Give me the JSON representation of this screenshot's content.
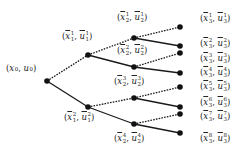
{
  "diagram": {
    "type": "tree",
    "root": {
      "id": "root",
      "label": "(x0, u0)",
      "x": 47,
      "y": 81,
      "label_x": 6,
      "label_y": 64,
      "plain": true
    },
    "nodes": [
      {
        "id": "n1_1",
        "var": "x",
        "ctl": "u",
        "sup": "1",
        "sub": "1",
        "x": 88,
        "y": 55,
        "label_x": 62,
        "label_y": 30
      },
      {
        "id": "n1_2",
        "var": "x",
        "ctl": "u",
        "sup": "2",
        "sub": "1",
        "x": 88,
        "y": 107,
        "label_x": 64,
        "label_y": 111
      },
      {
        "id": "n2_1",
        "var": "x",
        "ctl": "u",
        "sup": "1",
        "sub": "2",
        "x": 134,
        "y": 38,
        "label_x": 117,
        "label_y": 11
      },
      {
        "id": "n2_2",
        "var": "x",
        "ctl": "u",
        "sup": "2",
        "sub": "2",
        "x": 134,
        "y": 67,
        "label_x": 117,
        "label_y": 44
      },
      {
        "id": "n2_3",
        "var": "x",
        "ctl": "u",
        "sup": "3",
        "sub": "2",
        "x": 134,
        "y": 98,
        "label_x": 114,
        "label_y": 75
      },
      {
        "id": "n2_4",
        "var": "x",
        "ctl": "u",
        "sup": "4",
        "sub": "2",
        "x": 134,
        "y": 124,
        "label_x": 114,
        "label_y": 132
      },
      {
        "id": "n3_1",
        "var": "x",
        "ctl": "u",
        "sup": "1",
        "sub": "3",
        "x": 180,
        "y": 27,
        "label_x": 200,
        "label_y": 12
      },
      {
        "id": "n3_2",
        "var": "x",
        "ctl": "u",
        "sup": "2",
        "sub": "3",
        "x": 180,
        "y": 46,
        "label_x": 200,
        "label_y": 37
      },
      {
        "id": "n3_3",
        "var": "x",
        "ctl": "u",
        "sup": "3",
        "sub": "3",
        "x": 180,
        "y": 53,
        "label_x": 200,
        "label_y": 52
      },
      {
        "id": "n3_4",
        "var": "x",
        "ctl": "u",
        "sup": "4",
        "sub": "3",
        "x": 180,
        "y": 73,
        "label_x": 200,
        "label_y": 66
      },
      {
        "id": "n3_5",
        "var": "x",
        "ctl": "u",
        "sup": "5",
        "sub": "3",
        "x": 180,
        "y": 87,
        "label_x": 200,
        "label_y": 80
      },
      {
        "id": "n3_6",
        "var": "x",
        "ctl": "u",
        "sup": "6",
        "sub": "3",
        "x": 180,
        "y": 107,
        "label_x": 200,
        "label_y": 96
      },
      {
        "id": "n3_7",
        "var": "x",
        "ctl": "u",
        "sup": "7",
        "sub": "3",
        "x": 180,
        "y": 114,
        "label_x": 200,
        "label_y": 110
      },
      {
        "id": "n3_8",
        "var": "x",
        "ctl": "u",
        "sup": "8",
        "sub": "3",
        "x": 180,
        "y": 133,
        "label_x": 200,
        "label_y": 132
      }
    ],
    "edges": [
      {
        "from": "root",
        "to": "n1_1",
        "style": "dashed"
      },
      {
        "from": "root",
        "to": "n1_2",
        "style": "solid"
      },
      {
        "from": "n1_1",
        "to": "n2_1",
        "style": "dashed"
      },
      {
        "from": "n1_1",
        "to": "n2_2",
        "style": "solid"
      },
      {
        "from": "n1_2",
        "to": "n2_3",
        "style": "dashed"
      },
      {
        "from": "n1_2",
        "to": "n2_4",
        "style": "solid"
      },
      {
        "from": "n2_1",
        "to": "n3_1",
        "style": "dashed"
      },
      {
        "from": "n2_1",
        "to": "n3_2",
        "style": "solid"
      },
      {
        "from": "n2_2",
        "to": "n3_3",
        "style": "dashed"
      },
      {
        "from": "n2_2",
        "to": "n3_4",
        "style": "solid"
      },
      {
        "from": "n2_3",
        "to": "n3_5",
        "style": "dashed"
      },
      {
        "from": "n2_3",
        "to": "n3_6",
        "style": "solid"
      },
      {
        "from": "n2_4",
        "to": "n3_7",
        "style": "dashed"
      },
      {
        "from": "n2_4",
        "to": "n3_8",
        "style": "solid"
      }
    ],
    "colors": {
      "edge": "#1a1a1a",
      "node": "#111111",
      "text": "#222222"
    }
  }
}
